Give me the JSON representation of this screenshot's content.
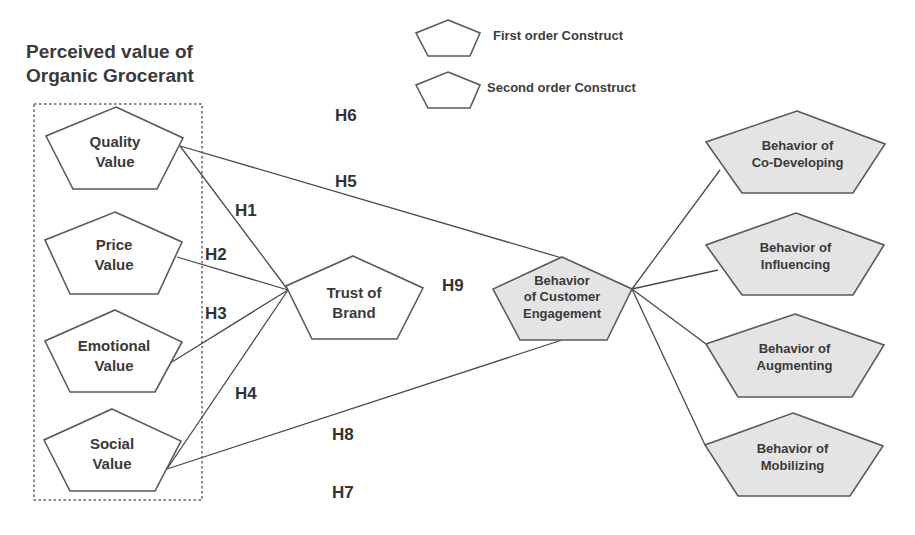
{
  "title": {
    "line1": "Perceived value of",
    "line2": "Organic Grocerant"
  },
  "legend": [
    {
      "shape": "pentagon-white",
      "label": "First order Construct"
    },
    {
      "shape": "pentagon-gray",
      "label": "Second order Construct"
    }
  ],
  "colors": {
    "first_order_fill": "#ffffff",
    "second_order_fill": "#e4e4e4",
    "stroke": "#5a5a5a",
    "text": "#3a3a3a"
  },
  "nodes": {
    "quality": {
      "line1": "Quality",
      "line2": "Value",
      "type": "first"
    },
    "price": {
      "line1": "Price",
      "line2": "Value",
      "type": "first"
    },
    "emotional": {
      "line1": "Emotional",
      "line2": "Value",
      "type": "first"
    },
    "social": {
      "line1": "Social",
      "line2": "Value",
      "type": "first"
    },
    "trust": {
      "line1": "Trust of",
      "line2": "Brand",
      "type": "first"
    },
    "engagement": {
      "line1": "Behavior",
      "line2": "of Customer",
      "line3": "Engagement",
      "type": "second"
    },
    "codeveloping": {
      "line1": "Behavior of",
      "line2": "Co-Developing",
      "type": "second"
    },
    "influencing": {
      "line1": "Behavior of",
      "line2": "Influencing",
      "type": "second"
    },
    "augmenting": {
      "line1": "Behavior of",
      "line2": "Augmenting",
      "type": "second"
    },
    "mobilizing": {
      "line1": "Behavior of",
      "line2": "Mobilizing",
      "type": "second"
    }
  },
  "hypotheses": {
    "h1": "H1",
    "h2": "H2",
    "h3": "H3",
    "h4": "H4",
    "h5": "H5",
    "h6": "H6",
    "h7": "H7",
    "h8": "H8",
    "h9": "H9"
  },
  "edges": [
    {
      "from": "quality",
      "to": "trust"
    },
    {
      "from": "price",
      "to": "trust"
    },
    {
      "from": "emotional",
      "to": "trust"
    },
    {
      "from": "social",
      "to": "trust"
    },
    {
      "from": "quality",
      "to": "engagement"
    },
    {
      "from": "social",
      "to": "engagement"
    },
    {
      "from": "engagement",
      "to": "codeveloping"
    },
    {
      "from": "engagement",
      "to": "influencing"
    },
    {
      "from": "engagement",
      "to": "augmenting"
    },
    {
      "from": "engagement",
      "to": "mobilizing"
    }
  ]
}
